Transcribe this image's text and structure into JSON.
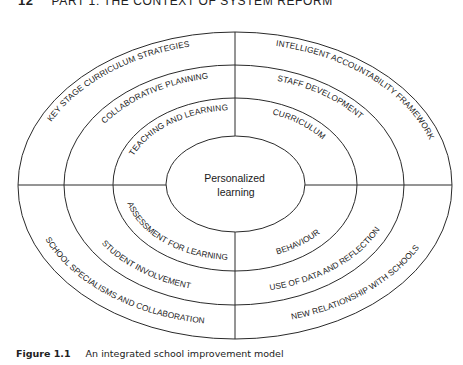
{
  "header": {
    "page_number": "12",
    "running_title": "PART 1: THE CONTEXT OF SYSTEM REFORM"
  },
  "diagram": {
    "center": {
      "line1": "Personalized",
      "line2": "learning"
    },
    "rings": {
      "outer": {
        "top_left": "KEY STAGE CURRICULUM STRATEGIES",
        "top_right": "INTELLIGENT ACCOUNTABILITY FRAMEWORK",
        "bottom_left": "SCHOOL SPECIALISMS AND COLLABORATION",
        "bottom_right": "NEW RELATIONSHIP WITH SCHOOLS"
      },
      "middle": {
        "top_left": "COLLABORATIVE PLANNING",
        "top_right": "STAFF DEVELOPMENT",
        "bottom_left": "STUDENT INVOLVEMENT",
        "bottom_right": "USE OF DATA AND REFLECTION"
      },
      "inner": {
        "top_left": "TEACHING AND LEARNING",
        "top_right": "CURRICULUM",
        "bottom_left": "ASSESSMENT FOR LEARNING",
        "bottom_right": "BEHAVIOUR"
      }
    }
  },
  "caption": {
    "label": "Figure 1.1",
    "text": "An integrated school improvement model"
  }
}
